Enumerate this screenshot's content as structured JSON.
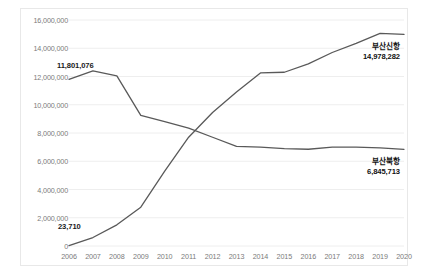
{
  "chart_data": {
    "type": "line",
    "title": "",
    "xlabel": "",
    "ylabel": "",
    "grid": true,
    "legend_position": "inline-end-labels",
    "x": [
      2006,
      2007,
      2008,
      2009,
      2010,
      2011,
      2012,
      2013,
      2014,
      2015,
      2016,
      2017,
      2018,
      2019,
      2020
    ],
    "xtick_labels": [
      "2006",
      "2007",
      "2008",
      "2009",
      "2010",
      "2011",
      "2012",
      "2013",
      "2014",
      "2015",
      "2016",
      "2017",
      "2018",
      "2019",
      "2020"
    ],
    "ylim": [
      0,
      16000000
    ],
    "ytick_values": [
      0,
      2000000,
      4000000,
      6000000,
      8000000,
      10000000,
      12000000,
      14000000,
      16000000
    ],
    "ytick_labels": [
      "0",
      "2,000,000",
      "4,000,000",
      "6,000,000",
      "8,000,000",
      "10,000,000",
      "12,000,000",
      "14,000,000",
      "16,000,000"
    ],
    "series": [
      {
        "name": "부산북항",
        "color": "#595959",
        "values": [
          11801076,
          12400000,
          12050000,
          9250000,
          8800000,
          8350000,
          7700000,
          7050000,
          7000000,
          6900000,
          6850000,
          7000000,
          7000000,
          6950000,
          6845713
        ],
        "start_label": "11,801,076",
        "end_label": "6,845,713"
      },
      {
        "name": "부산신항",
        "color": "#595959",
        "values": [
          23710,
          600000,
          1500000,
          2750000,
          5300000,
          7700000,
          9450000,
          10900000,
          12250000,
          12300000,
          12900000,
          13700000,
          14350000,
          15050000,
          14978282
        ],
        "start_label": "23,710",
        "end_label": "14,978,282"
      }
    ],
    "point_annotations": [
      {
        "name": "north-port-first-value",
        "text": "11,801,076",
        "x_px": 57,
        "y_px": 61
      },
      {
        "name": "new-port-first-value",
        "text": "23,710",
        "x_px": 58,
        "y_px": 222
      }
    ],
    "end_labels": [
      {
        "name": "new-port-end-label",
        "title": "부산신항",
        "value": "14,978,282",
        "x_px": 400,
        "y_px": 42
      },
      {
        "name": "north-port-end-label",
        "title": "부산북항",
        "value": "6,845,713",
        "x_px": 400,
        "y_px": 157
      }
    ],
    "style": {
      "grid_color": "#eeeeee",
      "axis_text_color": "#7b7b7b",
      "border_color": "#e8e8e8",
      "background": "#ffffff"
    }
  }
}
